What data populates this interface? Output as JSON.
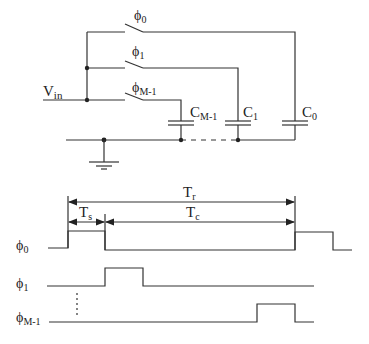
{
  "circuit": {
    "input_label": "V",
    "input_sub": "in",
    "switches": [
      {
        "label": "ϕ",
        "sub": "0"
      },
      {
        "label": "ϕ",
        "sub": "1"
      },
      {
        "label": "ϕ",
        "sub": "M-1"
      }
    ],
    "capacitors": [
      {
        "label": "C",
        "sub": "M-1"
      },
      {
        "label": "C",
        "sub": "1"
      },
      {
        "label": "C",
        "sub": "0"
      }
    ]
  },
  "timing": {
    "Tr": {
      "label": "T",
      "sub": "r"
    },
    "Ts": {
      "label": "T",
      "sub": "s"
    },
    "Tc": {
      "label": "T",
      "sub": "c"
    },
    "signals": [
      {
        "label": "ϕ",
        "sub": "0"
      },
      {
        "label": "ϕ",
        "sub": "1"
      },
      {
        "label": "ϕ",
        "sub": "M-1"
      }
    ]
  },
  "colors": {
    "line": "#333333",
    "background": "#ffffff"
  }
}
